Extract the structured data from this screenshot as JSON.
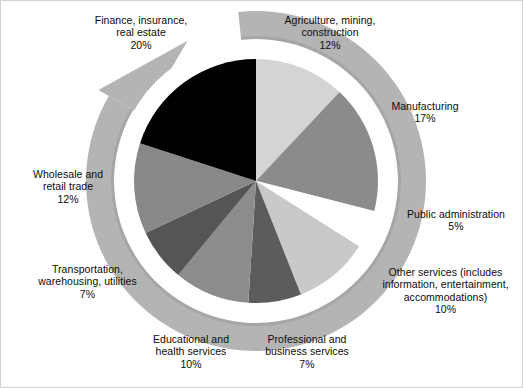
{
  "figure": {
    "background_color": "#ffffff",
    "frame_color": "#d2d2d2",
    "text_color": "#0c0c0c"
  },
  "chart_data": {
    "type": "pie",
    "title": "",
    "subtitle": "",
    "xlabel": "",
    "ylabel": "",
    "legend_position": "callouts-around-pie",
    "grid": false,
    "units": "percent",
    "total": 100,
    "start_angle_deg": 0,
    "direction": "clockwise",
    "categories": [
      "Agriculture, mining, construction",
      "Manufacturing",
      "Public administration",
      "Other services (includes information, entertainment, accommodations)",
      "Professional and business services",
      "Educational and health services",
      "Transportation, warehousing, utilities",
      "Wholesale and retail trade",
      "Finance, insurance, real estate"
    ],
    "values": [
      12,
      17,
      5,
      10,
      7,
      10,
      7,
      12,
      20
    ],
    "slice_colors": [
      "#d4d4d4",
      "#8b8b8b",
      "#ffffff",
      "#c9c9c9",
      "#5c5c5c",
      "#8c8c8c",
      "#555555",
      "#888888",
      "#000000"
    ],
    "slice_labels": [
      "12%",
      "17%",
      "5%",
      "10%",
      "7%",
      "10%",
      "7%",
      "12%",
      "20%"
    ]
  },
  "callouts": [
    {
      "name": "finance-insurance-real-estate",
      "label": "Finance, insurance,\nreal estate",
      "value": "20%",
      "text": "Finance, insurance,\nreal estate\n20%"
    },
    {
      "name": "agriculture-mining-construction",
      "label": "Agriculture, mining,\nconstruction",
      "value": "12%",
      "text": "Agriculture, mining,\nconstruction\n12%"
    },
    {
      "name": "manufacturing",
      "label": "Manufacturing",
      "value": "17%",
      "text": "Manufacturing\n17%"
    },
    {
      "name": "public-administration",
      "label": "Public administration",
      "value": "5%",
      "text": "Public administration\n5%"
    },
    {
      "name": "other-services",
      "label": "Other services (includes\ninformation, entertainment,\naccommodations)",
      "value": "10%",
      "text": "Other services (includes\ninformation, entertainment,\naccommodations)\n10%"
    },
    {
      "name": "professional-and-business-services",
      "label": "Professional and\nbusiness services",
      "value": "7%",
      "text": "Professional and\nbusiness services\n7%"
    },
    {
      "name": "educational-and-health-services",
      "label": "Educational and\nhealth services",
      "value": "10%",
      "text": "Educational and\nhealth services\n10%"
    },
    {
      "name": "transportation-warehousing-utilities",
      "label": "Transportation,\nwarehousing, utilities",
      "value": "7%",
      "text": "Transportation,\nwarehousing, utilities\n7%"
    },
    {
      "name": "wholesale-and-retail-trade",
      "label": "Wholesale and\nretail trade",
      "value": "12%",
      "text": "Wholesale and\nretail trade\n12%"
    }
  ],
  "decoration": {
    "ring_arrow_color": "#b4b4b4",
    "ring_arrow_shadow_color": "#9a9a9a",
    "ring_arrow_name": "circular-arrow-ring"
  }
}
